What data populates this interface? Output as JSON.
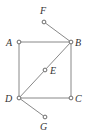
{
  "diagram": {
    "type": "graph",
    "colors": {
      "edge": "#7a7a7a",
      "node_stroke": "#5a5a5a",
      "label": "#333333",
      "background": "#ffffff"
    },
    "nodes": [
      {
        "id": "F",
        "label": "F",
        "x": 44,
        "y": 22,
        "lx": 40,
        "ly": 14
      },
      {
        "id": "A",
        "label": "A",
        "x": 19,
        "y": 42,
        "lx": 6,
        "ly": 46
      },
      {
        "id": "B",
        "label": "B",
        "x": 71,
        "y": 42,
        "lx": 75,
        "ly": 46
      },
      {
        "id": "E",
        "label": "E",
        "x": 45,
        "y": 70,
        "lx": 50,
        "ly": 74
      },
      {
        "id": "D",
        "label": "D",
        "x": 19,
        "y": 98,
        "lx": 5,
        "ly": 102
      },
      {
        "id": "C",
        "label": "C",
        "x": 71,
        "y": 98,
        "lx": 75,
        "ly": 102
      },
      {
        "id": "G",
        "label": "G",
        "x": 45,
        "y": 117,
        "lx": 40,
        "ly": 130
      }
    ],
    "edges": [
      {
        "from": "F",
        "to": "B"
      },
      {
        "from": "A",
        "to": "B"
      },
      {
        "from": "A",
        "to": "D"
      },
      {
        "from": "B",
        "to": "C"
      },
      {
        "from": "D",
        "to": "C"
      },
      {
        "from": "D",
        "to": "E"
      },
      {
        "from": "E",
        "to": "B"
      },
      {
        "from": "D",
        "to": "G"
      }
    ]
  }
}
